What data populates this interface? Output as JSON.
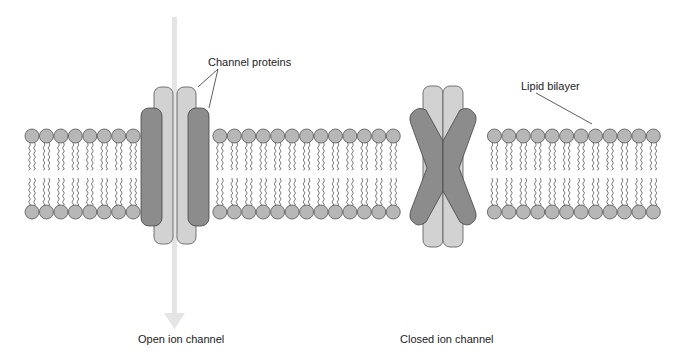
{
  "diagram": {
    "type": "ion-channel-membrane",
    "labels": {
      "channel_proteins": "Channel proteins",
      "lipid_bilayer": "Lipid bilayer",
      "open_channel": "Open ion channel",
      "closed_channel": "Closed ion channel"
    },
    "colors": {
      "lipid_head": "#b7b7b7",
      "lipid_stroke": "#555555",
      "protein_dark": "#8c8c8c",
      "protein_light": "#d2d2d2",
      "arrow": "#e4e4e4"
    },
    "membrane": {
      "head_radius": 7,
      "first_head_x": 32,
      "head_spacing": 14.45,
      "head_count": 44,
      "top_row_y": 136,
      "bottom_row_y": 212
    },
    "open_channel": {
      "center_x": 175
    },
    "closed_channel": {
      "center_x": 443
    }
  }
}
